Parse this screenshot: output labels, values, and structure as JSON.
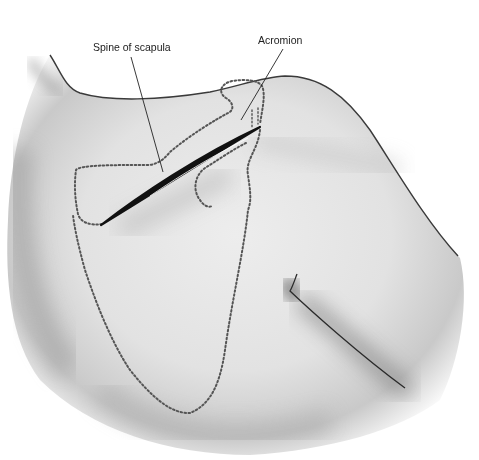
{
  "diagram": {
    "type": "anatomical-illustration",
    "labels": [
      {
        "id": "spine-of-scapula",
        "text": "Spine of scapula",
        "x": 93,
        "y": 41
      },
      {
        "id": "acromion",
        "text": "Acromion",
        "x": 258,
        "y": 34
      }
    ],
    "colors": {
      "background": "#ffffff",
      "skin_shadow": "#8a8a8a",
      "outline": "#3a3a3a",
      "dotted_outline": "#555555",
      "label_text": "#222222"
    }
  }
}
